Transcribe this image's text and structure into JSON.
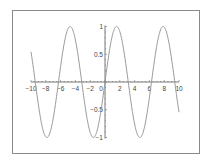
{
  "chart_data": {
    "type": "line",
    "title": "",
    "xlabel": "",
    "ylabel": "",
    "function": "sin(x)",
    "xlim": [
      -10,
      10
    ],
    "ylim": [
      -1,
      1
    ],
    "x_ticks": [
      -10,
      -8,
      -6,
      -4,
      -2,
      0,
      2,
      4,
      6,
      8,
      10
    ],
    "x_tick_labels": [
      "-10",
      "-8",
      "-6",
      "-4",
      "-2",
      "0",
      "2",
      "4",
      "6",
      "8",
      "10"
    ],
    "y_ticks": [
      1,
      0.5,
      -0.5,
      -1
    ],
    "y_tick_labels": [
      "1",
      "0.5",
      "-0.5",
      "-1"
    ],
    "grid": false,
    "legend": null,
    "series": [
      {
        "name": "sin(x)",
        "x": [
          -10,
          -9,
          -8,
          -7,
          -6,
          -5,
          -4,
          -3,
          -2,
          -1,
          0,
          1,
          2,
          3,
          4,
          5,
          6,
          7,
          8,
          9,
          10
        ],
        "values": [
          0.544,
          -0.412,
          -0.989,
          -0.657,
          0.279,
          0.959,
          0.757,
          -0.141,
          -0.909,
          -0.841,
          0,
          0.841,
          0.909,
          0.141,
          -0.757,
          -0.959,
          -0.279,
          0.657,
          0.989,
          0.412,
          -0.544
        ]
      }
    ]
  },
  "style": {
    "frame_color": "#8a8a8a",
    "axis_color": "#555555",
    "curve_color": "#9a9a9a"
  }
}
